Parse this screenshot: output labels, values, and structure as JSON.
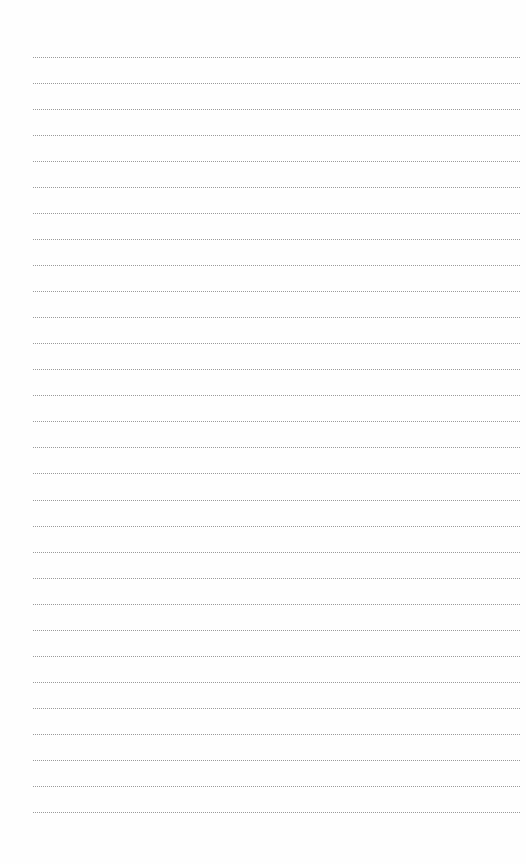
{
  "page": {
    "type": "lined-paper",
    "line_count": 30,
    "first_line_y": 57,
    "line_spacing": 26.03,
    "line_left": 33,
    "line_width": 487,
    "line_style": "dotted",
    "line_color": "#9a9a9a",
    "background_color": "#fefefe"
  }
}
